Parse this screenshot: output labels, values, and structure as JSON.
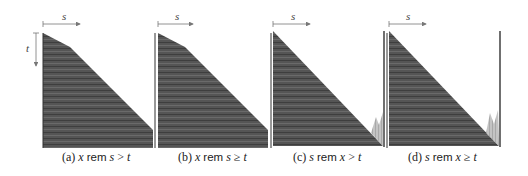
{
  "figure": {
    "axis_labels": {
      "horizontal": "s",
      "vertical": "t"
    },
    "colors": {
      "dark_fill": "#4a4a4a",
      "light_fill": "#b0b0b0",
      "axis_line": "#777777",
      "border": "#333333"
    },
    "panels": [
      {
        "id": "a",
        "tag": "(a)",
        "lhs": "x",
        "op": "rem",
        "rhs": "s",
        "rel": ">",
        "rhs2": "t"
      },
      {
        "id": "b",
        "tag": "(b)",
        "lhs": "x",
        "op": "rem",
        "rhs": "s",
        "rel": "≥",
        "rhs2": "t"
      },
      {
        "id": "c",
        "tag": "(c)",
        "lhs": "s",
        "op": "rem",
        "rhs": "x",
        "rel": ">",
        "rhs2": "t"
      },
      {
        "id": "d",
        "tag": "(d)",
        "lhs": "s",
        "op": "rem",
        "rhs": "x",
        "rel": "≥",
        "rhs2": "t"
      }
    ]
  }
}
